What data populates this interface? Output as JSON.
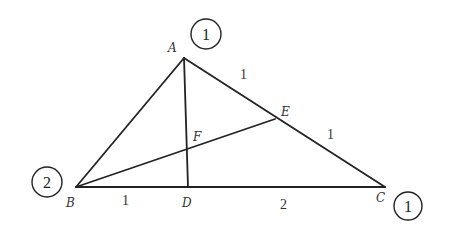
{
  "diagram": {
    "type": "triangle-mass-points",
    "points": {
      "A": {
        "label": "A",
        "x": 184,
        "y": 58
      },
      "B": {
        "label": "B",
        "x": 76,
        "y": 187
      },
      "C": {
        "label": "C",
        "x": 385,
        "y": 187
      },
      "D": {
        "label": "D",
        "x": 188,
        "y": 187
      },
      "E": {
        "label": "E",
        "x": 275,
        "y": 119
      },
      "F": {
        "label": "F",
        "x": 188,
        "y": 148
      }
    },
    "segments": [
      {
        "from": "A",
        "to": "B"
      },
      {
        "from": "A",
        "to": "C"
      },
      {
        "from": "B",
        "to": "C"
      },
      {
        "from": "A",
        "to": "D"
      },
      {
        "from": "B",
        "to": "E"
      }
    ],
    "length_labels": {
      "AE": "1",
      "EC": "1",
      "BD": "1",
      "DC": "2"
    },
    "mass_labels": {
      "A": "1",
      "B": "2",
      "C": "1"
    }
  }
}
